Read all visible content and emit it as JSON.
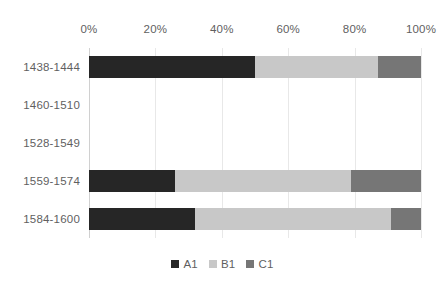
{
  "chart_data": {
    "type": "bar",
    "orientation": "horizontal",
    "stacked": true,
    "normalized": true,
    "title": "",
    "subtitle": "",
    "xlabel": "",
    "ylabel": "",
    "categories": [
      "1438-1444",
      "1460-1510",
      "1528-1549",
      "1559-1574",
      "1584-1600"
    ],
    "series": [
      {
        "name": "A1",
        "color": "#262626",
        "values": [
          50,
          0,
          0,
          26,
          32
        ]
      },
      {
        "name": "B1",
        "color": "#c8c8c8",
        "values": [
          37,
          0,
          0,
          53,
          59
        ]
      },
      {
        "name": "C1",
        "color": "#767676",
        "values": [
          13,
          0,
          0,
          21,
          9
        ]
      }
    ],
    "xticks": [
      "0%",
      "20%",
      "40%",
      "60%",
      "80%",
      "100%"
    ],
    "xtick_values": [
      0,
      20,
      40,
      60,
      80,
      100
    ],
    "xlim": [
      0,
      100
    ],
    "grid": true,
    "grid_axis": "x",
    "legend": [
      "A1",
      "B1",
      "C1"
    ],
    "legend_position": "bottom",
    "empty_categories": [
      "1460-1510",
      "1528-1549"
    ]
  },
  "colors": {
    "a1": "#262626",
    "b1": "#c8c8c8",
    "c1": "#767676",
    "gridline": "#e8e8e8",
    "axis": "#d0d0d0",
    "text": "#5f5f5f",
    "background": "#ffffff"
  }
}
